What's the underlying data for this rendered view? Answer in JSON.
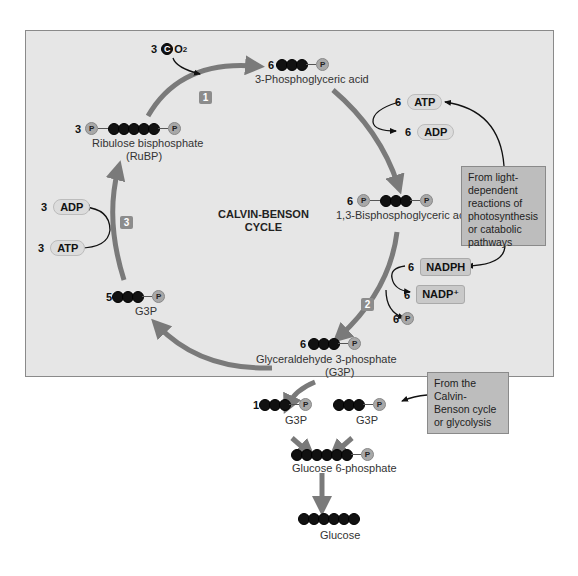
{
  "diagram": {
    "title": [
      "CALVIN-BENSON",
      "CYCLE"
    ],
    "colors": {
      "panel_bg": "#e6e6e6",
      "arrow": "#7a7a7a",
      "carbon": "#111111",
      "phosphate": "#a8a8a8",
      "note_bg": "#bdbdbd",
      "badge": "#8c8c8c"
    },
    "steps": [
      {
        "label": "1"
      },
      {
        "label": "2"
      },
      {
        "label": "3"
      }
    ],
    "inputs": {
      "co2": {
        "count": "3",
        "carbon": "C",
        "formula": "O",
        "subscript": "2"
      }
    },
    "molecules": {
      "pga": {
        "count": "6",
        "name": "3-Phosphoglyceric acid",
        "carbons": 3,
        "phosphates": "right"
      },
      "bpg": {
        "count": "6",
        "name": "1,3-Bisphosphoglyceric acid",
        "carbons": 3,
        "phosphates": "both"
      },
      "g3p_cycle": {
        "count": "6",
        "name": "Glyceraldehyde 3-phosphate",
        "abbr": "(G3P)",
        "carbons": 3
      },
      "g3p_recycle": {
        "count": "5",
        "name": "G3P",
        "carbons": 3
      },
      "rubp": {
        "count": "3",
        "name": "Ribulose bisphosphate",
        "abbr": "(RuBP)",
        "carbons": 5
      },
      "g3p_out1": {
        "count": "1",
        "name": "G3P",
        "carbons": 3
      },
      "g3p_out2": {
        "name": "G3P",
        "carbons": 3
      },
      "glucose6p": {
        "name": "Glucose 6-phosphate",
        "carbons": 6
      },
      "glucose": {
        "name": "Glucose",
        "carbons": 6
      }
    },
    "cofactors": {
      "step1_atp": {
        "count": "6",
        "label": "ATP"
      },
      "step1_adp": {
        "count": "6",
        "label": "ADP"
      },
      "nadph": {
        "count": "6",
        "label": "NADPH"
      },
      "nadp": {
        "count": "6",
        "label": "NADP⁺"
      },
      "pi": {
        "count": "6",
        "label": "P"
      },
      "step3_adp": {
        "count": "3",
        "label": "ADP"
      },
      "step3_atp": {
        "count": "3",
        "label": "ATP"
      }
    },
    "notes": {
      "light": "From light-dependent reactions of photosynthesis or catabolic pathways",
      "calvin": "From the Calvin-Benson cycle or glycolysis"
    },
    "symbols": {
      "carbon": "C",
      "phosphate": "P"
    }
  }
}
